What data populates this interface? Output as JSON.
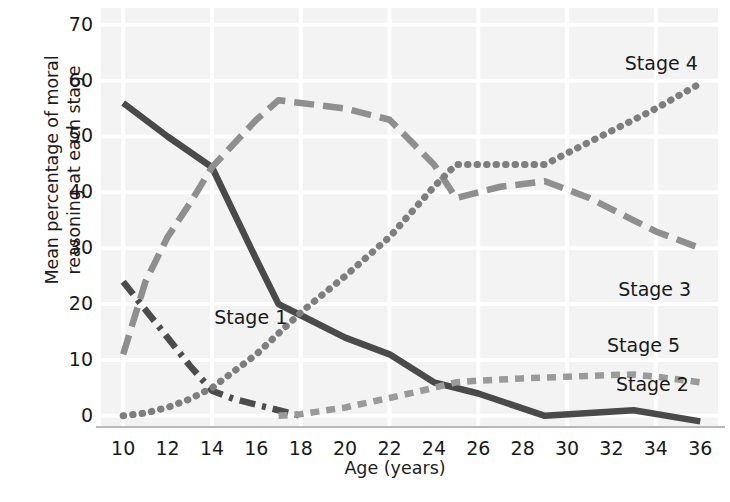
{
  "chart_data": {
    "type": "line",
    "title": "",
    "xlabel": "Age (years)",
    "ylabel_lines": [
      "Mean percentage of moral",
      "reasoning at each stage"
    ],
    "ylabel": "Mean percentage of moral reasoning at each stage",
    "xlim": [
      9,
      36.8
    ],
    "ylim": [
      -2,
      73
    ],
    "xticks": [
      10,
      12,
      14,
      16,
      18,
      20,
      22,
      24,
      26,
      28,
      30,
      32,
      34,
      36
    ],
    "yticks": [
      0,
      10,
      20,
      30,
      40,
      50,
      60,
      70
    ],
    "grid": true,
    "grid_color": "#ffffff",
    "plot_background": "#f3f3f3",
    "legend_position": "inline-annotations",
    "series": [
      {
        "name": "Stage 1",
        "label": "Stage 1",
        "style": "dash-dot",
        "color": "#4c4c4c",
        "label_x": 14.1,
        "label_y": 17.5,
        "x": [
          10,
          11,
          12,
          13,
          14,
          15,
          16,
          17,
          18
        ],
        "values": [
          24,
          19,
          14,
          9,
          4.5,
          3,
          2,
          1,
          0
        ]
      },
      {
        "name": "Stage 2",
        "label": "Stage 2",
        "style": "solid",
        "color": "#4a4a4a",
        "label_x": 32.2,
        "label_y": 5.5,
        "x": [
          10,
          12,
          14,
          16,
          17,
          18,
          20,
          22,
          24,
          26,
          29,
          33,
          36
        ],
        "values": [
          56,
          50,
          44.5,
          28,
          20,
          18,
          14,
          11,
          6,
          4,
          0,
          1,
          -1
        ]
      },
      {
        "name": "Stage 3",
        "label": "Stage 3",
        "style": "long-dash",
        "color": "#8f8f8f",
        "label_x": 32.3,
        "label_y": 22.5,
        "x": [
          10,
          11,
          12,
          13,
          14,
          16,
          17,
          18,
          20,
          22,
          24,
          25,
          26,
          27,
          29,
          31,
          33,
          34,
          36
        ],
        "values": [
          11,
          24,
          32,
          38,
          44.5,
          53,
          56.5,
          56,
          55,
          53,
          45,
          39,
          40,
          41,
          42,
          39,
          35,
          33,
          30
        ]
      },
      {
        "name": "Stage 4",
        "label": "Stage 4",
        "style": "dotted",
        "color": "#7e7e7e",
        "label_x": 32.6,
        "label_y": 63,
        "x": [
          10,
          11,
          12,
          13,
          14,
          16,
          18,
          20,
          22,
          24,
          25,
          26,
          28,
          29,
          30,
          32,
          34,
          36
        ],
        "values": [
          0,
          0.5,
          1.5,
          3,
          5,
          11,
          18.5,
          25,
          32,
          41,
          45,
          45,
          45,
          45,
          47,
          51,
          55,
          59.5
        ]
      },
      {
        "name": "Stage 5",
        "label": "Stage 5",
        "style": "short-dash",
        "color": "#9a9a9a",
        "label_x": 31.8,
        "label_y": 12.5,
        "x": [
          17,
          18,
          20,
          22,
          24,
          25,
          26,
          28,
          30,
          32,
          33,
          34,
          36
        ],
        "values": [
          0,
          0.3,
          1.5,
          3.2,
          5,
          6,
          6.3,
          6.7,
          7,
          7.3,
          7.4,
          7,
          6
        ]
      }
    ]
  },
  "axis": {
    "ytick_labels": [
      "70",
      "60",
      "50",
      "40",
      "30",
      "20",
      "10",
      "0"
    ],
    "xtick_labels": [
      "10",
      "12",
      "14",
      "16",
      "18",
      "20",
      "22",
      "24",
      "26",
      "28",
      "30",
      "32",
      "34",
      "36"
    ],
    "xlabel_text": "Age (years)",
    "ylabel_line1": "Mean percentage of moral",
    "ylabel_line2": "reasoning at each stage"
  },
  "annotations": {
    "stage1": "Stage 1",
    "stage2": "Stage 2",
    "stage3": "Stage 3",
    "stage4": "Stage 4",
    "stage5": "Stage 5"
  },
  "colors": {
    "plot_background": "#f3f3f3",
    "grid": "#ffffff",
    "axis_line": "#b9b9b9",
    "text": "#1a1a1a",
    "stage1": "#4c4c4c",
    "stage2": "#4a4a4a",
    "stage3": "#8f8f8f",
    "stage4": "#7e7e7e",
    "stage5": "#9a9a9a"
  }
}
